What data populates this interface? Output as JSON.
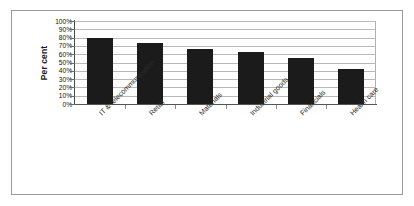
{
  "chart_data": {
    "type": "bar",
    "title": "",
    "xlabel": "",
    "ylabel": "Per cent",
    "categories": [
      "IT & telecommunication",
      "Retail",
      "Materials",
      "Industrial goods",
      "Financials",
      "Health care"
    ],
    "values": [
      79,
      73,
      66,
      63,
      56,
      42
    ],
    "ylim": [
      0,
      100
    ],
    "ytick_labels": [
      "100%",
      "90%",
      "80%",
      "70%",
      "60%",
      "50%",
      "40%",
      "30%",
      "20%",
      "10%",
      "0%"
    ],
    "ytick_values": [
      100,
      90,
      80,
      70,
      60,
      50,
      40,
      30,
      20,
      10,
      0
    ],
    "grid": true,
    "legend": "none",
    "series_color": "#1b1b1b",
    "gridline_color": "#b9b9b9",
    "frame_color": "#9a9a9a"
  }
}
